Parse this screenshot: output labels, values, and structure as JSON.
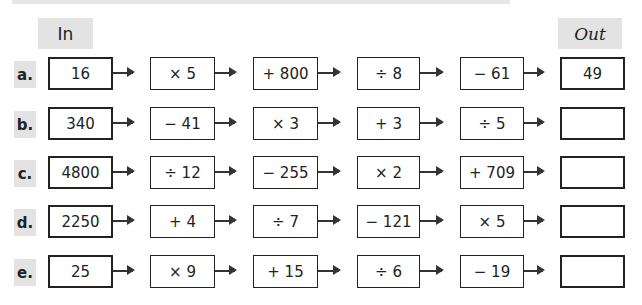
{
  "header": {
    "in_label": "In",
    "out_label": "Out"
  },
  "rows": [
    {
      "label": "a.",
      "in": "16",
      "ops": [
        "× 5",
        "+ 800",
        "÷ 8",
        "− 61"
      ],
      "out": "49"
    },
    {
      "label": "b.",
      "in": "340",
      "ops": [
        "− 41",
        "× 3",
        "+ 3",
        "÷ 5"
      ],
      "out": ""
    },
    {
      "label": "c.",
      "in": "4800",
      "ops": [
        "÷ 12",
        "− 255",
        "× 2",
        "+ 709"
      ],
      "out": ""
    },
    {
      "label": "d.",
      "in": "2250",
      "ops": [
        "+ 4",
        "÷ 7",
        "− 121",
        "× 5"
      ],
      "out": ""
    },
    {
      "label": "e.",
      "in": "25",
      "ops": [
        "× 9",
        "+ 15",
        "÷ 6",
        "− 19"
      ],
      "out": ""
    }
  ],
  "arrow_icon": "right-arrow-icon"
}
